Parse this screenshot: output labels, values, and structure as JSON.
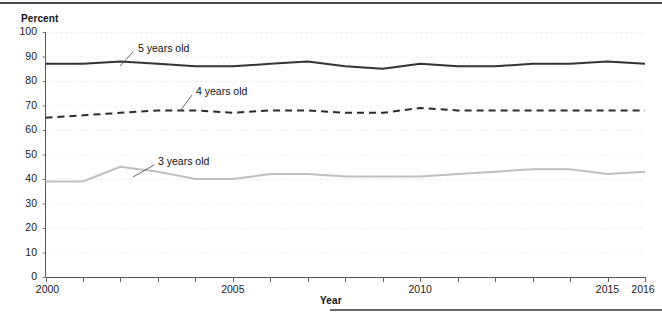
{
  "axis_titles": {
    "y": "Percent",
    "x": "Year"
  },
  "chart_data": {
    "type": "line",
    "title": "",
    "subtitle": "",
    "xlabel": "Year",
    "ylabel": "Percent",
    "xlim": [
      2000,
      2016
    ],
    "ylim": [
      0,
      100
    ],
    "grid": true,
    "grid_style": "dotted-horizontal",
    "legend_position": "inline-annotation",
    "x": [
      2000,
      2001,
      2002,
      2003,
      2004,
      2005,
      2006,
      2007,
      2008,
      2009,
      2010,
      2011,
      2012,
      2013,
      2014,
      2015,
      2016
    ],
    "x_tick_labels": [
      "2000",
      "2005",
      "2010",
      "2015",
      "2016"
    ],
    "x_tick_values": [
      2000,
      2005,
      2010,
      2015,
      2016
    ],
    "y_tick_labels": [
      "0",
      "10",
      "20",
      "30",
      "40",
      "50",
      "60",
      "70",
      "80",
      "90",
      "100"
    ],
    "y_tick_values": [
      0,
      10,
      20,
      30,
      40,
      50,
      60,
      70,
      80,
      90,
      100
    ],
    "series": [
      {
        "name": "5 years old",
        "label": "5 years old",
        "color": "#333333",
        "line_style": "solid",
        "line_width": 2,
        "values": [
          87,
          87,
          88,
          87,
          86,
          86,
          87,
          88,
          86,
          85,
          87,
          86,
          86,
          87,
          87,
          88,
          87
        ]
      },
      {
        "name": "4 years old",
        "label": "4 years old",
        "color": "#2b2b2b",
        "line_style": "dashed",
        "line_width": 2,
        "values": [
          65,
          66,
          67,
          68,
          68,
          67,
          68,
          68,
          67,
          67,
          69,
          68,
          68,
          68,
          68,
          68,
          68
        ]
      },
      {
        "name": "3 years old",
        "label": "3 years old",
        "color": "#bfbfbf",
        "line_style": "solid",
        "line_width": 2,
        "values": [
          39,
          39,
          45,
          43,
          40,
          40,
          42,
          42,
          41,
          41,
          41,
          42,
          43,
          44,
          44,
          42,
          43
        ]
      }
    ],
    "annotations": [
      {
        "text": "5 years old",
        "series": "5 years old",
        "label_x": 138,
        "label_y": 42,
        "leader_from_x": 133,
        "leader_from_y": 52,
        "leader_to_x": 120,
        "leader_to_y": 66
      },
      {
        "text": "4 years old",
        "series": "4 years old",
        "label_x": 196,
        "label_y": 85,
        "leader_from_x": 192,
        "leader_from_y": 95,
        "leader_to_x": 180,
        "leader_to_y": 111
      },
      {
        "text": "3 years old",
        "series": "3 years old",
        "label_x": 158,
        "label_y": 155,
        "leader_from_x": 154,
        "leader_from_y": 165,
        "leader_to_x": 133,
        "leader_to_y": 177
      }
    ]
  }
}
